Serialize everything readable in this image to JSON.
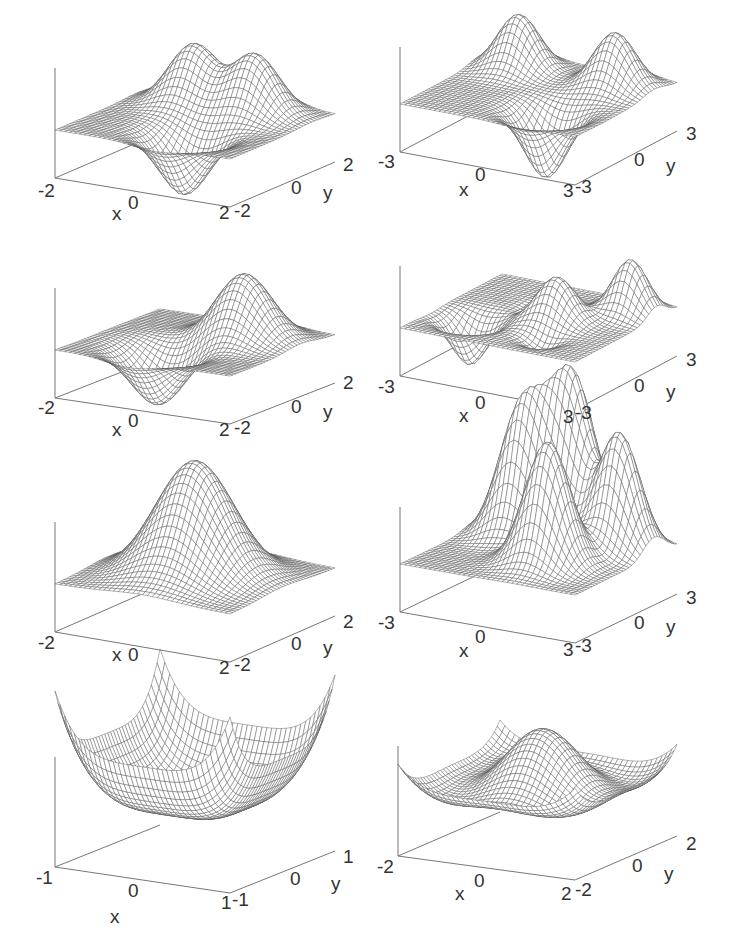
{
  "figure": {
    "background": "#ffffff",
    "line_color": "#555555",
    "axis_color": "#777777",
    "label_color": "#333333"
  },
  "chart_data": [
    {
      "type": "surface",
      "id": "p1",
      "title": "",
      "description": "Two positive peaks and one negative trough on a flat plane (wave-function-like lobes)",
      "xlabel": "x",
      "ylabel": "y",
      "xlim": [
        -2,
        2
      ],
      "ylim": [
        -2,
        2
      ],
      "x_ticks": [
        "-2",
        "0",
        "2"
      ],
      "y_ticks": [
        "-2",
        "0",
        "2"
      ],
      "grid": true,
      "func": "p1",
      "origin": [
        55,
        178
      ],
      "xend": [
        230,
        207
      ],
      "yend": [
        335,
        162
      ],
      "zup": 110,
      "zscale": 60,
      "zoffset": 0.0,
      "labels": {
        "xmin": "-2",
        "xmid": "0",
        "xmax": "2",
        "ymin": "-2",
        "ymid": "0",
        "ymax": "2",
        "x": "x",
        "y": "y"
      }
    },
    {
      "type": "surface",
      "id": "p2",
      "title": "",
      "description": "Two positive peaks at back, one deep trough at front, on flat plane",
      "xlabel": "x",
      "ylabel": "y",
      "xlim": [
        -3,
        3
      ],
      "ylim": [
        -3,
        3
      ],
      "x_ticks": [
        "-3",
        "0",
        "3"
      ],
      "y_ticks": [
        "-3",
        "0",
        "3"
      ],
      "grid": true,
      "func": "p2",
      "origin": [
        400,
        152
      ],
      "xend": [
        575,
        185
      ],
      "yend": [
        677,
        131
      ],
      "zup": 105,
      "zscale": 55,
      "zoffset": 0.0,
      "labels": {
        "xmin": "-3",
        "xmid": "0",
        "xmax": "3",
        "ymin": "-3",
        "ymid": "0",
        "ymax": "3",
        "x": "x",
        "y": "y"
      }
    },
    {
      "type": "surface",
      "id": "p3",
      "title": "",
      "description": "One positive peak and one negative trough (dipole-like)",
      "xlabel": "x",
      "ylabel": "y",
      "xlim": [
        -2,
        2
      ],
      "ylim": [
        -2,
        2
      ],
      "x_ticks": [
        "-2",
        "0",
        "2"
      ],
      "y_ticks": [
        "-2",
        "0",
        "2"
      ],
      "grid": true,
      "func": "p3",
      "origin": [
        55,
        398
      ],
      "xend": [
        230,
        424
      ],
      "yend": [
        335,
        383
      ],
      "zup": 110,
      "zscale": 55,
      "zoffset": 0.0,
      "labels": {
        "xmin": "-2",
        "xmid": "0",
        "xmax": "2",
        "ymin": "-2",
        "ymid": "0",
        "ymax": "2",
        "x": "x",
        "y": "y"
      }
    },
    {
      "type": "surface",
      "id": "p4",
      "title": "",
      "description": "Multiple alternating peaks and troughs along a diagonal",
      "xlabel": "x",
      "ylabel": "y",
      "xlim": [
        -3,
        3
      ],
      "ylim": [
        -3,
        3
      ],
      "x_ticks": [
        "-3",
        "0",
        "3"
      ],
      "y_ticks": [
        "-3",
        "0",
        "3"
      ],
      "grid": true,
      "func": "p4",
      "origin": [
        400,
        376
      ],
      "xend": [
        575,
        410
      ],
      "yend": [
        677,
        356
      ],
      "zup": 110,
      "zscale": 45,
      "zoffset": 0.0,
      "labels": {
        "xmin": "-3",
        "xmid": "0",
        "xmax": "3",
        "ymin": "-3",
        "ymid": "0",
        "ymax": "3",
        "x": "x",
        "y": "y"
      }
    },
    {
      "type": "surface",
      "id": "p5",
      "title": "",
      "description": "Single Gaussian bump centered at origin",
      "xlabel": "x",
      "ylabel": "y",
      "xlim": [
        -2,
        2
      ],
      "ylim": [
        -2,
        2
      ],
      "x_ticks": [
        "-2",
        "0",
        "2"
      ],
      "y_ticks": [
        "-2",
        "0",
        "2"
      ],
      "grid": true,
      "func": "p5",
      "origin": [
        55,
        632
      ],
      "xend": [
        230,
        662
      ],
      "yend": [
        335,
        616
      ],
      "zup": 110,
      "zscale": 115,
      "zoffset": 0.0,
      "labels": {
        "xmin": "-2",
        "xmid": "0",
        "xmax": "2",
        "ymin": "-2",
        "ymid": "0",
        "ymax": "2",
        "x": "x",
        "y": "y"
      }
    },
    {
      "type": "surface",
      "id": "p6",
      "title": "",
      "description": "Four Gaussian peaks arranged in a square",
      "xlabel": "x",
      "ylabel": "y",
      "xlim": [
        -3,
        3
      ],
      "ylim": [
        -3,
        3
      ],
      "x_ticks": [
        "-3",
        "0",
        "3"
      ],
      "y_ticks": [
        "-3",
        "0",
        "3"
      ],
      "grid": true,
      "func": "p6",
      "origin": [
        400,
        612
      ],
      "xend": [
        575,
        643
      ],
      "yend": [
        677,
        594
      ],
      "zup": 105,
      "zscale": 130,
      "zoffset": 0.0,
      "labels": {
        "xmin": "-3",
        "xmid": "0",
        "xmax": "3",
        "ymin": "-3",
        "ymid": "0",
        "ymax": "3",
        "x": "x",
        "y": "y"
      }
    },
    {
      "type": "surface",
      "id": "p7",
      "title": "",
      "description": "Quartic bowl (x^4 + y^4 like) with sharp raised corners",
      "xlabel": "x",
      "ylabel": "y",
      "xlim": [
        -1,
        1
      ],
      "ylim": [
        -1,
        1
      ],
      "x_ticks": [
        "-1",
        "0",
        "1"
      ],
      "y_ticks": [
        "-1",
        "0",
        "1"
      ],
      "grid": true,
      "func": "p7",
      "origin": [
        55,
        867
      ],
      "xend": [
        230,
        893
      ],
      "yend": [
        335,
        851
      ],
      "zup": 110,
      "zscale": 70,
      "zoffset": 0.0,
      "labels": {
        "xmin": "-1",
        "xmid": "0",
        "xmax": "1",
        "ymin": "-1",
        "ymid": "0",
        "ymax": "1",
        "x": "x",
        "y": "y"
      }
    },
    {
      "type": "surface",
      "id": "p8",
      "title": "",
      "description": "Double-well potential plus central bump; raised corners",
      "xlabel": "x",
      "ylabel": "y",
      "xlim": [
        -2,
        2
      ],
      "ylim": [
        -2,
        2
      ],
      "x_ticks": [
        "-2",
        "0",
        "2"
      ],
      "y_ticks": [
        "-2",
        "0",
        "2"
      ],
      "grid": true,
      "func": "p8",
      "origin": [
        398,
        856
      ],
      "xend": [
        575,
        880
      ],
      "yend": [
        677,
        836
      ],
      "zup": 110,
      "zscale": 95,
      "zoffset": 0.0,
      "labels": {
        "xmin": "-2",
        "xmid": "0",
        "xmax": "2",
        "ymin": "-2",
        "ymid": "0",
        "ymax": "2",
        "x": "x",
        "y": "y"
      }
    }
  ]
}
